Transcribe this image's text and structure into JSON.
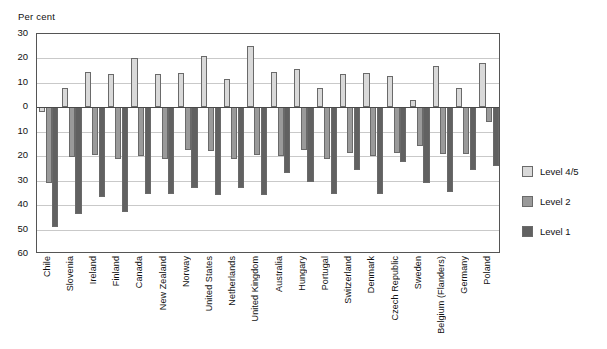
{
  "figure": {
    "cut_title": "",
    "axis_unit_label": "Per cent"
  },
  "legend": {
    "position": "right",
    "items": [
      {
        "label": "Level 4/5",
        "color": "#d9d9d9"
      },
      {
        "label": "Level 2",
        "color": "#9a9a9a"
      },
      {
        "label": "Level 1",
        "color": "#616161"
      }
    ]
  },
  "chart_data": {
    "type": "bar",
    "title": "",
    "xlabel": "",
    "ylabel": "Per cent",
    "ylim": [
      -60,
      30
    ],
    "ytick_labels": [
      "30",
      "20",
      "10",
      "0",
      "10",
      "20",
      "30",
      "40",
      "50",
      "60"
    ],
    "ytick_values": [
      30,
      20,
      10,
      0,
      -10,
      -20,
      -30,
      -40,
      -50,
      -60
    ],
    "grid": true,
    "note": "Negative axis tick labels are displayed without minus signs.",
    "categories": [
      "Chile",
      "Slovenia",
      "Ireland",
      "Finland",
      "Canada",
      "New Zealand",
      "Norway",
      "United States",
      "Netherlands",
      "United Kingdom",
      "Australia",
      "Hungary",
      "Portugal",
      "Switzerland",
      "Denmark",
      "Czech Republic",
      "Sweden",
      "Belgium (Flanders)",
      "Germany",
      "Poland"
    ],
    "series": [
      {
        "name": "Level 4/5",
        "color": "#d9d9d9",
        "values": [
          -2,
          8,
          14.5,
          13.5,
          20,
          13.5,
          14,
          21,
          11.5,
          25,
          14.5,
          15.5,
          8,
          13.5,
          14,
          13,
          3,
          17,
          8,
          18
        ]
      },
      {
        "name": "Level 2",
        "color": "#9a9a9a",
        "values": [
          -31,
          -20.5,
          -19.5,
          -21,
          -20,
          -21,
          -17.5,
          -18,
          -21,
          -19.5,
          -20,
          -17.5,
          -21,
          -18.5,
          -20,
          -18.5,
          -16,
          -19,
          -19,
          -6
        ]
      },
      {
        "name": "Level 1",
        "color": "#616161",
        "values": [
          -49,
          -43.5,
          -36.5,
          -43,
          -35.5,
          -35.5,
          -33,
          -36,
          -33,
          -36,
          -27,
          -30.5,
          -35.5,
          -25.5,
          -35.5,
          -22.5,
          -31,
          -34.5,
          -25.5,
          -24
        ]
      }
    ]
  }
}
